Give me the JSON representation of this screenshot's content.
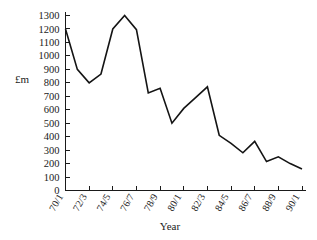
{
  "chart_data": {
    "type": "line",
    "title": "",
    "xlabel": "Year",
    "ylabel": "£m",
    "ylim": [
      0,
      1300
    ],
    "ytick_step": 100,
    "grid": false,
    "legend": null,
    "line_color": "#141414",
    "x": [
      "70/1",
      "71/2",
      "72/3",
      "73/4",
      "74/5",
      "75/6",
      "76/7",
      "77/8",
      "78/9",
      "79/80",
      "80/1",
      "81/2",
      "82/3",
      "83/4",
      "84/5",
      "85/6",
      "86/7",
      "87/8",
      "88/9",
      "89/90",
      "90/1"
    ],
    "xtick_labels": [
      "70/1",
      "72/3",
      "74/5",
      "76/7",
      "78/9",
      "80/1",
      "82/3",
      "84/5",
      "86/7",
      "88/9",
      "90/1"
    ],
    "ytick_labels": [
      "0",
      "100",
      "200",
      "300",
      "400",
      "500",
      "600",
      "700",
      "800",
      "900",
      "1000",
      "1100",
      "1200",
      "1300"
    ],
    "values": [
      1200,
      900,
      800,
      865,
      1200,
      1300,
      1195,
      725,
      760,
      500,
      610,
      690,
      770,
      410,
      350,
      280,
      365,
      215,
      250,
      200,
      160
    ],
    "series": [
      {
        "name": "£m",
        "values": [
          1200,
          900,
          800,
          865,
          1200,
          1300,
          1195,
          725,
          760,
          500,
          610,
          690,
          770,
          410,
          350,
          280,
          365,
          215,
          250,
          200,
          160
        ]
      }
    ]
  },
  "axes": {
    "y_axis_title": "£m",
    "x_axis_title": "Year"
  }
}
